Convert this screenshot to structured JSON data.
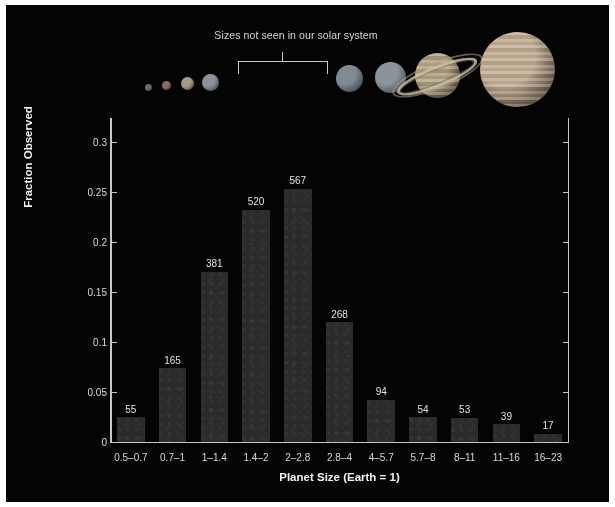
{
  "chart_data": {
    "type": "bar",
    "title": "",
    "subtitle": "",
    "xlabel": "Planet Size (Earth = 1)",
    "ylabel": "Fraction Observed",
    "categories": [
      "0.5–0.7",
      "0.7–1",
      "1–1.4",
      "1.4–2",
      "2–2.8",
      "2.8–4",
      "4–5.7",
      "5.7–8",
      "8–11",
      "11–16",
      "16–23"
    ],
    "values": [
      0.0245,
      0.0735,
      0.17,
      0.232,
      0.253,
      0.1195,
      0.042,
      0.0242,
      0.0236,
      0.0174,
      0.0076
    ],
    "bar_labels": [
      "55",
      "165",
      "381",
      "520",
      "567",
      "268",
      "94",
      "54",
      "53",
      "39",
      "17"
    ],
    "counts": [
      55,
      165,
      381,
      520,
      567,
      268,
      94,
      54,
      53,
      39,
      17
    ],
    "ylim": [
      0,
      0.325
    ],
    "yticks": [
      0,
      0.05,
      0.1,
      0.15,
      0.2,
      0.25,
      0.3
    ],
    "ytick_labels": [
      "0",
      "0.05",
      "0.1",
      "0.15",
      "0.2",
      "0.25",
      "0.3"
    ],
    "grid": false,
    "legend": "none",
    "annotations": [
      {
        "text": "Sizes not seen in our solar system",
        "type": "bracket",
        "covers": [
          "1.4–2",
          "2–2.8"
        ]
      }
    ]
  },
  "annotation": {
    "bracket_text": "Sizes not seen in our solar system"
  },
  "planets": [
    {
      "name": "Mercury",
      "icon": "planet-mercury-icon",
      "left": 139,
      "top": 79,
      "size": 7,
      "body": "#6d6a66",
      "shade": "#2a2824"
    },
    {
      "name": "Mars",
      "icon": "planet-mars-icon",
      "left": 156,
      "top": 76,
      "size": 9,
      "body": "#8a6f5e",
      "shade": "#30241d"
    },
    {
      "name": "Venus",
      "icon": "planet-venus-icon",
      "left": 175,
      "top": 72,
      "size": 13,
      "body": "#a89a86",
      "shade": "#3a342c"
    },
    {
      "name": "Earth",
      "icon": "planet-earth-icon",
      "left": 196,
      "top": 69,
      "size": 17,
      "body": "#8d9199",
      "shade": "#2c3038"
    },
    {
      "name": "Neptune",
      "icon": "planet-neptune-icon",
      "left": 330,
      "top": 60,
      "size": 27,
      "body": "#7f8a92",
      "shade": "#242b31"
    },
    {
      "name": "Uranus",
      "icon": "planet-uranus-icon",
      "left": 369,
      "top": 57,
      "size": 31,
      "body": "#8c9399",
      "shade": "#2a3035"
    },
    {
      "name": "Saturn",
      "icon": "planet-saturn-icon",
      "left": 409,
      "top": 48,
      "size": 45,
      "body": "#b3a68b",
      "shade": "#3b342a"
    },
    {
      "name": "Jupiter",
      "icon": "planet-jupiter-icon",
      "left": 474,
      "top": 27,
      "size": 75,
      "body": "#c2b09a",
      "shade": "#3f352b"
    }
  ],
  "colors": {
    "background": "#040405",
    "page_border": "#ffffff",
    "bar_fill": "#2b2b2c",
    "axis": "#c7c7c7",
    "text": "#e2e2e2"
  }
}
